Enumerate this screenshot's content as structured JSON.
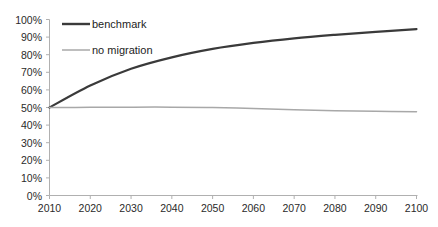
{
  "chart_data": {
    "type": "line",
    "title": "",
    "xlabel": "",
    "ylabel": "",
    "x": [
      2010,
      2020,
      2030,
      2040,
      2050,
      2060,
      2070,
      2080,
      2090,
      2100
    ],
    "xlim": [
      2010,
      2100
    ],
    "ylim": [
      0,
      1.0
    ],
    "grid": false,
    "legend_position": "top-left-inside",
    "y_tick_labels": [
      "100%",
      "90%",
      "80%",
      "70%",
      "60%",
      "50%",
      "40%",
      "30%",
      "20%",
      "10%",
      "0%"
    ],
    "y_tick_values": [
      1.0,
      0.9,
      0.8,
      0.7,
      0.6,
      0.5,
      0.4,
      0.3,
      0.2,
      0.1,
      0.0
    ],
    "x_tick_labels": [
      "2010",
      "2020",
      "2030",
      "2040",
      "2050",
      "2060",
      "2070",
      "2080",
      "2090",
      "2100"
    ],
    "series": [
      {
        "name": "benchmark",
        "color": "#3a3a3a",
        "values": [
          0.5,
          0.625,
          0.72,
          0.785,
          0.833,
          0.867,
          0.893,
          0.913,
          0.93,
          0.945
        ]
      },
      {
        "name": "no migration",
        "color": "#a8a8a8",
        "values": [
          0.5,
          0.501,
          0.502,
          0.502,
          0.5,
          0.495,
          0.487,
          0.481,
          0.478,
          0.476
        ]
      }
    ]
  },
  "legend": {
    "items": [
      {
        "label": "benchmark",
        "color": "#3a3a3a"
      },
      {
        "label": "no migration",
        "color": "#a8a8a8"
      }
    ]
  },
  "axis": {
    "line_color": "#b0b0b0",
    "tick_color": "#b0b0b0",
    "text_color": "#2a2a2a"
  }
}
